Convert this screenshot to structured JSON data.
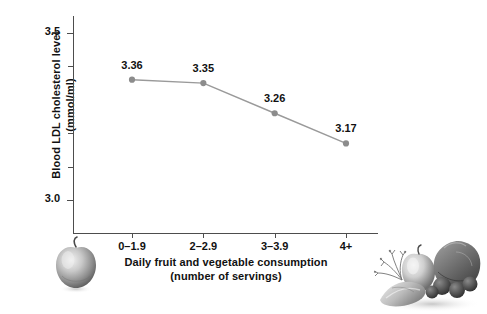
{
  "chart_data": {
    "type": "line",
    "title": "",
    "subtitle": "",
    "xlabel_line1": "Daily fruit and vegetable consumption",
    "xlabel_line2": "(number of servings)",
    "ylabel_line1": "Blood LDL cholesterol level",
    "ylabel_line2": "(mmol/ml)",
    "categories": [
      "0–1.9",
      "2–2.9",
      "3–3.9",
      "4+"
    ],
    "values": [
      3.36,
      3.35,
      3.26,
      3.17
    ],
    "point_labels": [
      "3.36",
      "3.35",
      "3.26",
      "3.17"
    ],
    "ylim": [
      2.9,
      3.55
    ],
    "y_major_ticks": [
      "3.5",
      "3.0"
    ],
    "y_major_tick_values": [
      3.5,
      3.0
    ],
    "y_minor_tick_values": [
      3.4,
      3.3,
      3.2,
      3.1
    ],
    "grid": false,
    "legend": "none",
    "series_color": "#9a9a9a",
    "marker_color": "#8c8c8c",
    "axis_color": "#4d4d4d",
    "text_color": "#111111",
    "background_color": "#ffffff"
  },
  "artwork": {
    "apple_name": "apple illustration",
    "produce_name": "fruit and vegetable pile illustration"
  }
}
